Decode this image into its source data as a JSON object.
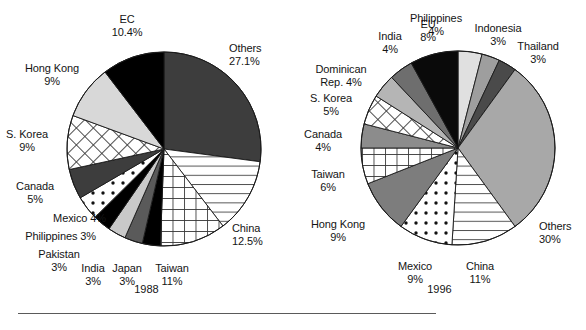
{
  "figure": {
    "background_color": "#ffffff",
    "divider_color": "#5a5a5a"
  },
  "palette": {
    "black": "#000000",
    "dark_gray": "#3d3d3d",
    "mid_dark_gray": "#5a5a5a",
    "gray": "#8c8c8c",
    "mid_gray": "#9e9e9e",
    "light_gray": "#c9c9c9",
    "very_light_gray": "#e0e0e0",
    "white": "#ffffff",
    "outline": "#1a1a1a"
  },
  "charts": [
    {
      "id": "pie-1988",
      "year_caption": "1988",
      "labels": [
        {
          "name": "others",
          "text": "Others\n27.1%",
          "align": "lft",
          "x": 229,
          "y": 42
        },
        {
          "name": "china",
          "text": "China\n12.5%",
          "align": "lft",
          "x": 232,
          "y": 222
        },
        {
          "name": "taiwan",
          "text": "Taiwan\n11%",
          "align": "ctr",
          "x": 172,
          "y": 262
        },
        {
          "name": "japan",
          "text": "Japan\n3%",
          "align": "ctr",
          "x": 127,
          "y": 262
        },
        {
          "name": "india",
          "text": "India\n3%",
          "align": "ctr",
          "x": 93,
          "y": 262
        },
        {
          "name": "pakistan",
          "text": "Pakistan\n3%",
          "align": "ctr",
          "x": 59,
          "y": 248
        },
        {
          "name": "philippines",
          "text": "Philippines 3%",
          "align": "rgt",
          "x": 0,
          "y": 230
        },
        {
          "name": "mexico",
          "text": "Mexico 4%",
          "align": "rgt",
          "x": 10,
          "y": 212
        },
        {
          "name": "canada",
          "text": "Canada\n5%",
          "align": "ctr",
          "x": 35,
          "y": 180
        },
        {
          "name": "s-korea",
          "text": "S. Korea\n9%",
          "align": "ctr",
          "x": 27,
          "y": 128
        },
        {
          "name": "hong-kong",
          "text": "Hong Kong\n9%",
          "align": "ctr",
          "x": 52,
          "y": 62
        },
        {
          "name": "ec",
          "text": "EC\n10.4%",
          "align": "ctr",
          "x": 127,
          "y": 13
        }
      ]
    },
    {
      "id": "pie-1996",
      "year_caption": "1996",
      "labels": [
        {
          "name": "philippines",
          "text": "Philippines\n4%",
          "align": "ctr",
          "x": 143,
          "y": 12
        },
        {
          "name": "indonesia",
          "text": "Indonesia\n3%",
          "align": "ctr",
          "x": 205,
          "y": 22
        },
        {
          "name": "thailand",
          "text": "Thailand\n3%",
          "align": "ctr",
          "x": 245,
          "y": 40
        },
        {
          "name": "others",
          "text": "Others\n30%",
          "align": "lft",
          "x": 246,
          "y": 220
        },
        {
          "name": "china",
          "text": "China\n11%",
          "align": "ctr",
          "x": 187,
          "y": 260
        },
        {
          "name": "mexico",
          "text": "Mexico\n9%",
          "align": "ctr",
          "x": 122,
          "y": 260
        },
        {
          "name": "hong-kong",
          "text": "Hong Kong\n9%",
          "align": "ctr",
          "x": 45,
          "y": 218
        },
        {
          "name": "taiwan",
          "text": "Taiwan\n6%",
          "align": "ctr",
          "x": 35,
          "y": 168
        },
        {
          "name": "canada",
          "text": "Canada\n4%",
          "align": "ctr",
          "x": 30,
          "y": 128
        },
        {
          "name": "s-korea",
          "text": "S. Korea\n5%",
          "align": "ctr",
          "x": 38,
          "y": 92
        },
        {
          "name": "dominican",
          "text": "Dominican\nRep. 4%",
          "align": "ctr",
          "x": 48,
          "y": 63
        },
        {
          "name": "india",
          "text": "India\n4%",
          "align": "ctr",
          "x": 97,
          "y": 30
        },
        {
          "name": "eu",
          "text": "EU\n8%",
          "align": "ctr",
          "x": 135,
          "y": 18
        }
      ]
    }
  ],
  "chart_data": [
    {
      "type": "pie",
      "title": "1988",
      "cx": 164,
      "cy": 149,
      "r": 97,
      "start_angle_deg": 0,
      "direction": "clockwise",
      "total": 100,
      "legend": "labels-around-pie",
      "categories": [
        "Others",
        "China",
        "Taiwan",
        "Japan",
        "India",
        "Pakistan",
        "Philippines",
        "Mexico",
        "Canada",
        "S. Korea",
        "Hong Kong",
        "EC"
      ],
      "values": [
        27.1,
        12.5,
        11,
        3,
        3,
        3,
        3,
        4,
        5,
        9,
        9,
        10.4
      ],
      "value_labels": [
        "27.1%",
        "12.5%",
        "11%",
        "3%",
        "3%",
        "3%",
        "3%",
        "4%",
        "5%",
        "9%",
        "9%",
        "10.4%"
      ],
      "slices": [
        {
          "label": "Others",
          "value": 27.1,
          "fill": "#3d3d3d",
          "pattern": "solid"
        },
        {
          "label": "China",
          "value": 12.5,
          "fill": "#ffffff",
          "pattern": "horizontal-lines"
        },
        {
          "label": "Taiwan",
          "value": 11,
          "fill": "#ffffff",
          "pattern": "grid"
        },
        {
          "label": "Japan",
          "value": 3,
          "fill": "#000000",
          "pattern": "solid"
        },
        {
          "label": "India",
          "value": 3,
          "fill": "#5a5a5a",
          "pattern": "solid"
        },
        {
          "label": "Pakistan",
          "value": 3,
          "fill": "#c9c9c9",
          "pattern": "solid"
        },
        {
          "label": "Philippines",
          "value": 3,
          "fill": "#000000",
          "pattern": "solid"
        },
        {
          "label": "Mexico",
          "value": 4,
          "fill": "#ffffff",
          "pattern": "polka-dots"
        },
        {
          "label": "Canada",
          "value": 5,
          "fill": "#3d3d3d",
          "pattern": "solid"
        },
        {
          "label": "S. Korea",
          "value": 9,
          "fill": "#ffffff",
          "pattern": "diagonal-crosshatch"
        },
        {
          "label": "Hong Kong",
          "value": 9,
          "fill": "#d8d8d8",
          "pattern": "solid"
        },
        {
          "label": "EC",
          "value": 10.4,
          "fill": "#000000",
          "pattern": "solid"
        }
      ]
    },
    {
      "type": "pie",
      "title": "1996",
      "cx": 165,
      "cy": 148,
      "r": 97,
      "start_angle_deg": 0,
      "direction": "clockwise",
      "total": 100,
      "legend": "labels-around-pie",
      "categories": [
        "Philippines",
        "Indonesia",
        "Thailand",
        "Others",
        "China",
        "Mexico",
        "Hong Kong",
        "Taiwan",
        "Canada",
        "S. Korea",
        "Dominican Rep.",
        "India",
        "EU"
      ],
      "values": [
        4,
        3,
        3,
        30,
        11,
        9,
        9,
        6,
        4,
        5,
        4,
        4,
        8
      ],
      "value_labels": [
        "4%",
        "3%",
        "3%",
        "30%",
        "11%",
        "9%",
        "9%",
        "6%",
        "4%",
        "5%",
        "4%",
        "4%",
        "8%"
      ],
      "slices": [
        {
          "label": "Philippines",
          "value": 4,
          "fill": "#e0e0e0",
          "pattern": "solid"
        },
        {
          "label": "Indonesia",
          "value": 3,
          "fill": "#9e9e9e",
          "pattern": "solid"
        },
        {
          "label": "Thailand",
          "value": 3,
          "fill": "#4a4a4a",
          "pattern": "solid"
        },
        {
          "label": "Others",
          "value": 30,
          "fill": "#a8a8a8",
          "pattern": "solid"
        },
        {
          "label": "China",
          "value": 11,
          "fill": "#ffffff",
          "pattern": "horizontal-lines"
        },
        {
          "label": "Mexico",
          "value": 9,
          "fill": "#ffffff",
          "pattern": "polka-dots"
        },
        {
          "label": "Hong Kong",
          "value": 9,
          "fill": "#7d7d7d",
          "pattern": "solid"
        },
        {
          "label": "Taiwan",
          "value": 6,
          "fill": "#ffffff",
          "pattern": "grid"
        },
        {
          "label": "Canada",
          "value": 4,
          "fill": "#8c8c8c",
          "pattern": "solid"
        },
        {
          "label": "S. Korea",
          "value": 5,
          "fill": "#ffffff",
          "pattern": "diagonal-crosshatch"
        },
        {
          "label": "Dominican Rep.",
          "value": 4,
          "fill": "#b5b5b5",
          "pattern": "solid"
        },
        {
          "label": "India",
          "value": 4,
          "fill": "#6e6e6e",
          "pattern": "solid"
        },
        {
          "label": "EU",
          "value": 8,
          "fill": "#0a0a0a",
          "pattern": "solid"
        }
      ]
    }
  ]
}
